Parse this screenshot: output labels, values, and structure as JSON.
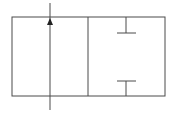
{
  "diagram": {
    "type": "valve-symbol",
    "colors": {
      "background": "#ffffff",
      "stroke": "#4a4a4a",
      "arrow": "#222222"
    },
    "envelopes": [
      {
        "id": "left",
        "state": "open-flow",
        "flow_direction": "up"
      },
      {
        "id": "right",
        "state": "blocked",
        "blocked_ports": [
          "top",
          "bottom"
        ]
      }
    ]
  }
}
